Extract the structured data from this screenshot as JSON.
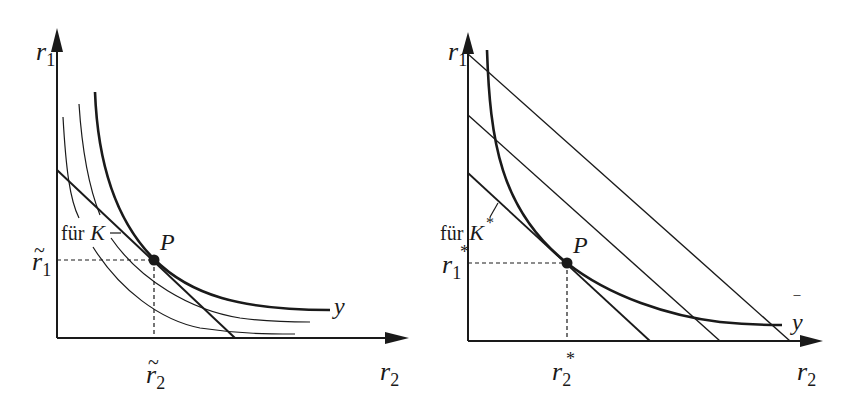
{
  "figure": {
    "left_panel": {
      "y_axis_label": "r",
      "y_axis_sub": "1",
      "x_axis_label": "r",
      "x_axis_sub": "2",
      "point_label": "P",
      "tick_r1_label": "r",
      "tick_r1_sub": "1",
      "tick_r1_mark": "~",
      "tick_r2_label": "r",
      "tick_r2_sub": "2",
      "tick_r2_mark": "~",
      "line_label_prefix": "für",
      "line_label": "K",
      "curve_label": "y"
    },
    "right_panel": {
      "y_axis_label": "r",
      "y_axis_sub": "1",
      "x_axis_label": "r",
      "x_axis_sub": "2",
      "point_label": "P",
      "tick_r1_label": "r",
      "tick_r1_sub": "1",
      "tick_r1_mark": "*",
      "tick_r2_label": "r",
      "tick_r2_sub": "2",
      "tick_r2_mark": "*",
      "line_label_prefix": "für",
      "line_label": "K",
      "line_label_mark": "*",
      "curve_label": "y",
      "curve_label_mark": "‾"
    }
  },
  "colors": {
    "ink": "#1a1a1a",
    "background": "#ffffff"
  }
}
